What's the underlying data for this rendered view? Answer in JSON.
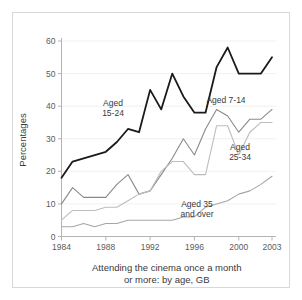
{
  "chart_data": {
    "type": "line",
    "title": "",
    "caption": "Attending the cinema once a month or more: by age, GB",
    "caption_line1": "Attending the cinema once a month",
    "caption_line2": "or more: by age, GB",
    "xlabel": "",
    "ylabel": "Percentages",
    "xlim": [
      1984,
      2003
    ],
    "ylim": [
      0,
      60
    ],
    "ytick_step": 10,
    "yticks": [
      0,
      10,
      20,
      30,
      40,
      50,
      60
    ],
    "xticks": [
      1984,
      1988,
      1992,
      1996,
      2000,
      2003
    ],
    "xtick_labels": [
      "1984",
      "1988",
      "1992",
      "1996",
      "2000",
      "2003"
    ],
    "ytick_labels": [
      "0",
      "10",
      "20",
      "30",
      "40",
      "50",
      "60"
    ],
    "grid": true,
    "grid_axis": "y",
    "legend": "inline-labels",
    "x": [
      1984,
      1985,
      1986,
      1987,
      1988,
      1989,
      1990,
      1991,
      1992,
      1993,
      1994,
      1995,
      1996,
      1997,
      1998,
      1999,
      2000,
      2001,
      2002,
      2003
    ],
    "series": [
      {
        "name": "Aged 15-24",
        "label": "Aged",
        "label_line1": "Aged",
        "label_line2": "15-24",
        "color": "#1a1a1a",
        "width": 1.8,
        "values": [
          18,
          23,
          24,
          25,
          26,
          29,
          33,
          32,
          45,
          39,
          50,
          43,
          38,
          38,
          52,
          58,
          50,
          50,
          50,
          55
        ]
      },
      {
        "name": "Aged 7-14",
        "label": "Aged 7-14",
        "label_line1": "Aged 7-14",
        "label_line2": "",
        "color": "#8a8a8a",
        "width": 1.1,
        "values": [
          10,
          15,
          12,
          12,
          12,
          16,
          19,
          13,
          14,
          19,
          24,
          30,
          25,
          33,
          39,
          37,
          32,
          36,
          36,
          39
        ]
      },
      {
        "name": "Aged 25-34",
        "label": "Aged",
        "label_line1": "Aged",
        "label_line2": "25-34",
        "color": "#bdbdbd",
        "width": 1.1,
        "values": [
          5,
          8,
          8,
          8,
          9,
          9,
          11,
          13,
          14,
          20,
          23,
          23,
          19,
          19,
          34,
          34,
          25,
          32,
          35,
          35
        ]
      },
      {
        "name": "Aged 35 and over",
        "label": "Aged 35 and over",
        "label_line1": "Aged 35",
        "label_line2": "and over",
        "color": "#a6a6a6",
        "width": 1.1,
        "values": [
          3,
          3,
          4,
          3,
          4,
          4,
          5,
          5,
          5,
          5,
          5,
          6,
          6,
          9,
          10,
          11,
          13,
          14,
          16,
          18.5
        ]
      }
    ],
    "annotations": [
      {
        "name": "label-aged-15-24",
        "lines": [
          "Aged",
          "15-24"
        ],
        "x": 113,
        "y": 106
      },
      {
        "name": "label-aged-7-14",
        "lines": [
          "Aged 7-14"
        ],
        "x": 226,
        "y": 103
      },
      {
        "name": "label-aged-25-34",
        "lines": [
          "Aged",
          "25-34"
        ],
        "x": 240,
        "y": 150
      },
      {
        "name": "label-aged-35-over",
        "lines": [
          "Aged 35",
          "and over"
        ],
        "x": 197,
        "y": 207
      }
    ]
  }
}
